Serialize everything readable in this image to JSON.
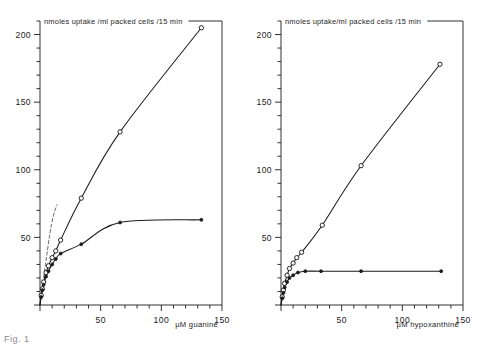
{
  "figure": {
    "background": "#ffffff",
    "ink_color": "#1b1b1b",
    "caption_fragment": "Fig. 1"
  },
  "chart_data": [
    {
      "type": "scatter",
      "panel": "left",
      "title": "",
      "xlabel": "µM guanine",
      "ylabel": "nmoles uptake /ml packed cells /15 min",
      "xlim": [
        0,
        150
      ],
      "ylim": [
        0,
        210
      ],
      "xticks": [
        0,
        50,
        100,
        150
      ],
      "xtick_labels": [
        "",
        "50",
        "100",
        "150"
      ],
      "yticks": [
        0,
        50,
        100,
        150,
        200
      ],
      "ytick_labels": [
        "",
        "50",
        "100",
        "150",
        "200"
      ],
      "x_minor_step": 10,
      "y_minor_step": 10,
      "grid": false,
      "legend": "none",
      "series": [
        {
          "name": "total uptake",
          "marker": "open-circle",
          "line": "solid",
          "x": [
            0,
            1,
            2,
            3,
            5,
            7,
            10,
            13,
            17,
            34,
            66,
            133
          ],
          "y": [
            0,
            7,
            12,
            17,
            24,
            29,
            35,
            40,
            48,
            79,
            128,
            205
          ]
        },
        {
          "name": "carrier-mediated uptake",
          "marker": "filled-circle",
          "line": "solid",
          "x": [
            0,
            1,
            2,
            3,
            5,
            7,
            10,
            13,
            17,
            34,
            66,
            133
          ],
          "y": [
            0,
            6,
            11,
            15,
            21,
            25,
            30,
            34,
            38,
            45,
            61,
            63
          ]
        },
        {
          "name": "initial slope reference",
          "marker": "none",
          "line": "dashed",
          "x": [
            0,
            2,
            5,
            8,
            11,
            14
          ],
          "y": [
            0,
            14,
            33,
            52,
            66,
            74
          ]
        }
      ]
    },
    {
      "type": "scatter",
      "panel": "right",
      "title": "",
      "xlabel": "µM hypoxanthine",
      "ylabel": "nmoles uptake/ml packed cells /15 min",
      "xlim": [
        0,
        150
      ],
      "ylim": [
        0,
        210
      ],
      "xticks": [
        0,
        50,
        100,
        150
      ],
      "xtick_labels": [
        "",
        "50",
        "100",
        "150"
      ],
      "yticks": [
        0,
        50,
        100,
        150,
        200
      ],
      "ytick_labels": [
        "",
        "50",
        "100",
        "150",
        "200"
      ],
      "x_minor_step": 10,
      "y_minor_step": 10,
      "grid": false,
      "legend": "none",
      "series": [
        {
          "name": "total uptake",
          "marker": "open-circle",
          "line": "solid",
          "x": [
            0,
            1,
            2,
            3,
            5,
            7,
            10,
            13,
            17,
            34,
            66,
            131
          ],
          "y": [
            0,
            6,
            11,
            16,
            22,
            27,
            31,
            35,
            39,
            59,
            103,
            178
          ]
        },
        {
          "name": "carrier-mediated uptake",
          "marker": "filled-circle",
          "line": "solid",
          "x": [
            0,
            1,
            2,
            3,
            5,
            7,
            10,
            14,
            20,
            33,
            66,
            132
          ],
          "y": [
            0,
            5,
            9,
            13,
            17,
            20,
            22,
            24,
            25,
            25,
            25,
            25
          ]
        }
      ]
    }
  ]
}
